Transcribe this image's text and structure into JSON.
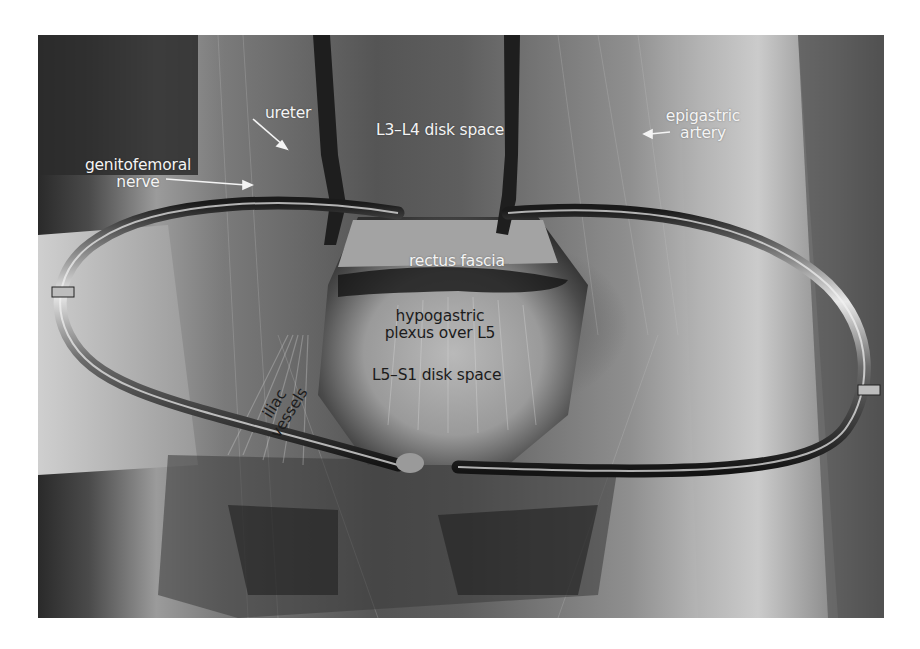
{
  "figure": {
    "type": "grayscale intraoperative photograph",
    "background_color": "#ffffff",
    "photo_bounds": {
      "x": 38,
      "y": 35,
      "width": 846,
      "height": 583
    },
    "annotations": {
      "ureter": "ureter",
      "genitofemoral_line1": "genitofemoral",
      "genitofemoral_line2": "nerve",
      "l3l4": "L3–L4 disk space",
      "epigastric_line1": "epigastric",
      "epigastric_line2": "artery",
      "rectus_fascia": "rectus fascia",
      "hypogastric_line1": "hypogastric",
      "hypogastric_line2": "plexus over L5",
      "l5s1": "L5–S1 disk space",
      "iliac_line1": "iliac",
      "iliac_line2": "vessels"
    },
    "label_colors": {
      "light": "#f4f4f4",
      "dark": "#1c1c1c"
    }
  }
}
